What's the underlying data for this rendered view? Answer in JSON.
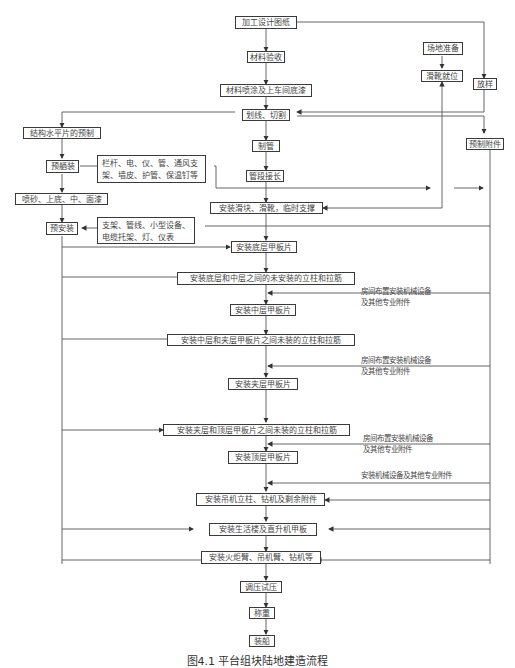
{
  "diagram": {
    "caption": "图4.1 平台组块陆地建造流程",
    "nodes": {
      "design": "加工设计图纸",
      "material_check": "材料验收",
      "material_paint": "材料喷涂及上车间底漆",
      "cut": "划线、切割",
      "pipe_make": "制管",
      "pipe_extend": "管段接长",
      "skid_install": "安装滑块、滑靴，临时支撑",
      "site_prep": "场地准备",
      "skid_place": "滑靴就位",
      "layout": "放样",
      "prefab_parts": "预制附件",
      "struct_prefab": "结构水平片的预制",
      "preassembly_outfit": "预舾装",
      "outfit_items": "栏杆、电、仪、管、通风支架、墙皮、护管、保温钉等",
      "blast_paint": "喷砂、上底、中、面漆",
      "pre_install": "预安装",
      "pre_install_items": "支架、管线、小型设备、电缆托架、灯、仪表",
      "bottom_deck": "安装底层甲板片",
      "bottom_mid_columns": "安装底层和中层之间的未安装的立柱和拉筋",
      "mid_deck": "安装中层甲板片",
      "mid_mezz_columns": "安装中层和夹层甲板片之间未装的立柱和拉筋",
      "mezz_deck": "安装夹层甲板片",
      "mezz_top_columns": "安装夹层和顶层甲板片之间未装的立柱和拉筋",
      "top_deck": "安装顶层甲板片",
      "crane_pedestal": "安装吊机立柱、钻机及剩余附件",
      "living_quarters": "安装生活楼及直升机甲板",
      "flare_boom": "安装火炬臂、吊机臂、钻机等",
      "pressure_test": "调压试压",
      "weighing": "称重",
      "loadout": "装船"
    },
    "notes": {
      "room_equip_1": [
        "房间布置安装机械设备",
        "及其他专业附件"
      ],
      "room_equip_2": [
        "房间布置安装机械设备",
        "及其他专业附件"
      ],
      "room_equip_3": [
        "房间布置安装机械设备",
        "及其他专业附件"
      ],
      "equip_misc": "安装机械设备及其他专业附件"
    }
  }
}
